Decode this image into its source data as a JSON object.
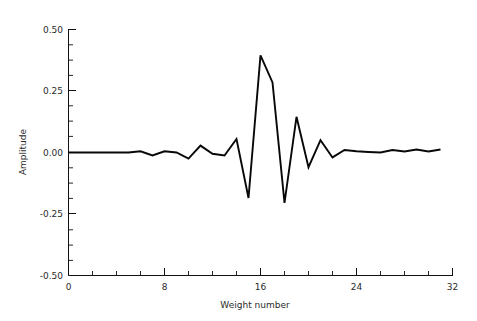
{
  "chart_data": {
    "type": "line",
    "title": "",
    "subtitle": "",
    "xlabel": "Weight number",
    "ylabel": "Amplitude",
    "xlim": [
      0,
      32
    ],
    "ylim": [
      -0.5,
      0.5
    ],
    "grid": false,
    "legend": null,
    "x_ticks": [
      0,
      8,
      16,
      24,
      32
    ],
    "x_tick_labels": [
      "0",
      "8",
      "16",
      "24",
      "32"
    ],
    "x_minor_tick_interval": 2,
    "y_ticks": [
      -0.5,
      -0.25,
      0.0,
      0.25,
      0.5
    ],
    "y_tick_labels": [
      "-0.50",
      "-0.25",
      "0.00",
      "0.25",
      "0.50"
    ],
    "y_minor_tick_interval": 0.0625,
    "line_color": "#080808",
    "background_color": "#ffffff",
    "x": [
      0,
      1,
      2,
      3,
      4,
      5,
      6,
      7,
      8,
      9,
      10,
      11,
      12,
      13,
      14,
      15,
      16,
      17,
      18,
      19,
      20,
      21,
      22,
      23,
      24,
      25,
      26,
      27,
      28,
      29,
      30,
      31
    ],
    "values": [
      0.0,
      0.0,
      0.0,
      0.0,
      0.0,
      0.0,
      0.005,
      -0.012,
      0.005,
      0.0,
      -0.025,
      0.028,
      -0.005,
      -0.012,
      0.055,
      -0.185,
      0.395,
      0.285,
      -0.205,
      0.145,
      -0.06,
      0.05,
      -0.02,
      0.01,
      0.005,
      0.002,
      0.0,
      0.01,
      0.004,
      0.012,
      0.004,
      0.012
    ],
    "series": [
      {
        "name": "Filter weights",
        "values": [
          0.0,
          0.0,
          0.0,
          0.0,
          0.0,
          0.0,
          0.005,
          -0.012,
          0.005,
          0.0,
          -0.025,
          0.028,
          -0.005,
          -0.012,
          0.055,
          -0.185,
          0.395,
          0.285,
          -0.205,
          0.145,
          -0.06,
          0.05,
          -0.02,
          0.01,
          0.005,
          0.002,
          0.0,
          0.01,
          0.004,
          0.012,
          0.004,
          0.012
        ]
      }
    ],
    "annotations": []
  },
  "axes": {
    "y_axis_label": "Amplitude",
    "x_axis_label": "Weight number"
  }
}
